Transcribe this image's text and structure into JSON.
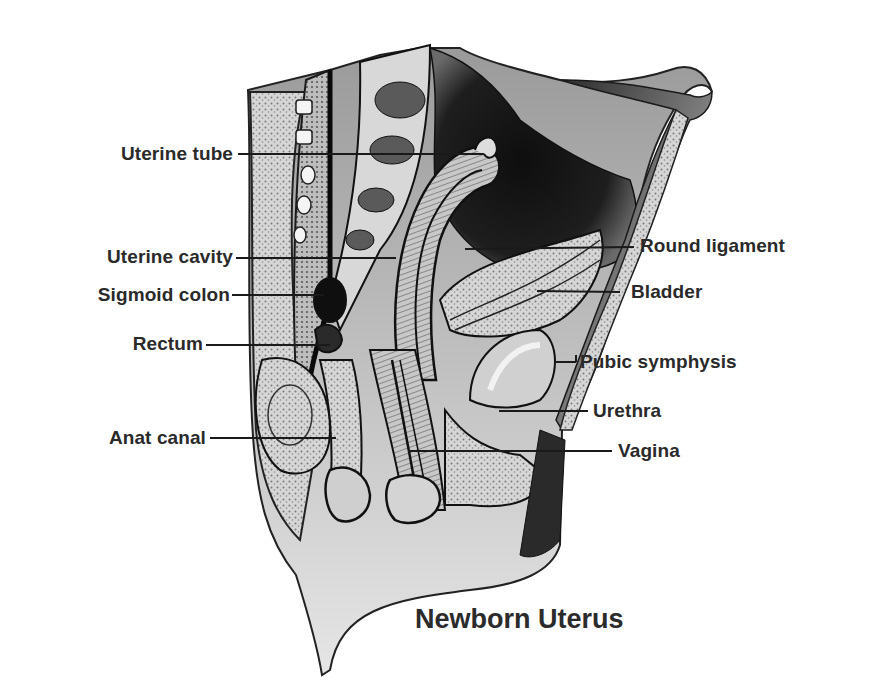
{
  "diagram": {
    "title": "Newborn Uterus",
    "style": "grayscale engraving, sagittal section of newborn female pelvis",
    "colors": {
      "background": "#ffffff",
      "ink": "#1a1a1a",
      "label_text": "#2a2a2a",
      "tissue_light": "#cfcfcf",
      "tissue_mid": "#9a9a9a",
      "cavity_dark": "#141414"
    },
    "labels_left": [
      {
        "id": "uterine-tube",
        "text": "Uterine tube"
      },
      {
        "id": "uterine-cavity",
        "text": "Uterine cavity"
      },
      {
        "id": "sigmoid-colon",
        "text": "Sigmoid colon"
      },
      {
        "id": "rectum",
        "text": "Rectum"
      },
      {
        "id": "anat-canal",
        "text": "Anat canal"
      }
    ],
    "labels_right": [
      {
        "id": "round-ligament",
        "text": "Round ligament"
      },
      {
        "id": "bladder",
        "text": "Bladder"
      },
      {
        "id": "pubic-symphysis",
        "text": "Pubic symphysis"
      },
      {
        "id": "urethra",
        "text": "Urethra"
      },
      {
        "id": "vagina",
        "text": "Vagina"
      }
    ]
  }
}
